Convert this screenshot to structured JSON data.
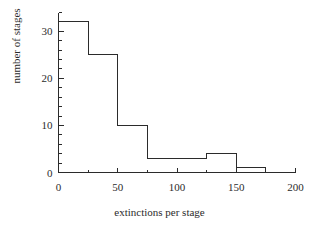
{
  "chart_data": {
    "type": "bar",
    "title": "",
    "subtitle": "",
    "xlabel": "extinctions per stage",
    "ylabel": "number of stages",
    "xlim": [
      0,
      200
    ],
    "ylim": [
      0,
      34
    ],
    "grid": false,
    "legend": null,
    "bin_width": 25,
    "categories": [
      "0-25",
      "25-50",
      "50-75",
      "75-100",
      "100-125",
      "125-150",
      "150-175",
      "175-200"
    ],
    "bin_edges": [
      0,
      25,
      50,
      75,
      100,
      125,
      150,
      175,
      200
    ],
    "values": [
      32,
      25,
      10,
      3,
      3,
      4,
      1,
      0
    ],
    "x_ticks_major": [
      0,
      50,
      100,
      150,
      200
    ],
    "x_tick_labels": [
      "0",
      "50",
      "100",
      "150",
      "200"
    ],
    "x_ticks_minor_step": 25,
    "y_ticks_major": [
      0,
      10,
      20,
      30
    ],
    "y_tick_labels": [
      "0",
      "10",
      "20",
      "30"
    ],
    "y_ticks_minor_step": 2,
    "colors": {
      "background": "#ffffff",
      "line": "#2b2b2b",
      "bar_fill": "none",
      "bar_stroke": "#2b2b2b",
      "text": "#2b2b2b"
    }
  }
}
